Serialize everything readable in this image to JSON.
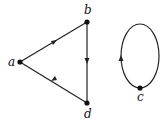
{
  "diagram": {
    "type": "directed-graph",
    "nodes": [
      {
        "id": "a",
        "label": "a",
        "x": 20,
        "y": 62,
        "lx": 9,
        "ly": 66
      },
      {
        "id": "b",
        "label": "b",
        "x": 87,
        "y": 22,
        "lx": 84,
        "ly": 14
      },
      {
        "id": "d",
        "label": "d",
        "x": 87,
        "y": 103,
        "lx": 84,
        "ly": 118
      },
      {
        "id": "c",
        "label": "c",
        "x": 140,
        "y": 88,
        "lx": 137,
        "ly": 101
      }
    ],
    "edges": [
      {
        "from": "a",
        "to": "b"
      },
      {
        "from": "b",
        "to": "d"
      },
      {
        "from": "d",
        "to": "a"
      },
      {
        "from": "c",
        "to": "c",
        "kind": "loop"
      }
    ],
    "colors": {
      "stroke": "#222222",
      "background": "#ffffff"
    }
  }
}
